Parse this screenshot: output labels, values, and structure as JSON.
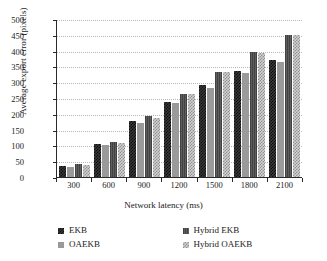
{
  "chart_data": {
    "type": "bar",
    "title": "",
    "xlabel": "Network latency (ms)",
    "ylabel": "Average export error (pixels)",
    "categories": [
      "300",
      "600",
      "900",
      "1200",
      "1500",
      "1800",
      "2100"
    ],
    "ylim": [
      0,
      500
    ],
    "yticks": [
      500,
      450,
      400,
      350,
      300,
      250,
      200,
      150,
      100,
      50,
      0
    ],
    "grid": "horizontal-dotted",
    "legend_position": "bottom",
    "series": [
      {
        "name": "EKB",
        "pattern": "dark-checker",
        "color": "#1f1f1f",
        "values": [
          35,
          103,
          176,
          238,
          291,
          336,
          371
        ]
      },
      {
        "name": "OAEKB",
        "pattern": "gray-solid",
        "color": "#9a9a9a",
        "values": [
          33,
          101,
          172,
          233,
          283,
          328,
          364
        ]
      },
      {
        "name": "Hybrid EKB",
        "pattern": "dark-gray",
        "color": "#5e5e5e",
        "values": [
          42,
          110,
          192,
          264,
          333,
          395,
          450
        ]
      },
      {
        "name": "Hybrid OAEKB",
        "pattern": "light-checker",
        "color": "#d2d2d2",
        "values": [
          38,
          108,
          188,
          264,
          332,
          394,
          450
        ]
      }
    ]
  }
}
